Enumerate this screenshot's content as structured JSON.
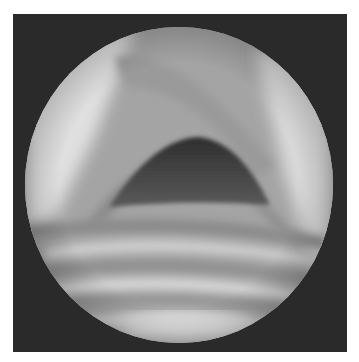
{
  "image": {
    "kind": "endoscopic-view",
    "description": "Grayscale circular endoscopic view showing a triangular dark airway opening above horizontally ridged tissue",
    "colors": {
      "background": "#ffffff",
      "frame": "#2a2a2a",
      "tissue_mid": "#a8a8a8",
      "tissue_light": "#e4e4e4",
      "opening_dark": "#3c3c3c"
    }
  }
}
